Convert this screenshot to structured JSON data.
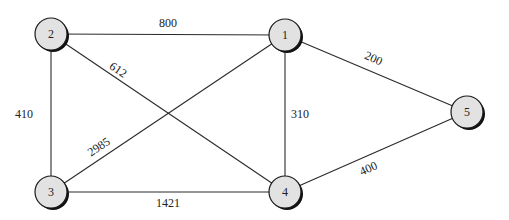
{
  "diagram": {
    "type": "weighted-undirected-graph",
    "nodes": [
      {
        "id": "1",
        "label": "1",
        "x": 285,
        "y": 35
      },
      {
        "id": "2",
        "label": "2",
        "x": 51,
        "y": 34
      },
      {
        "id": "3",
        "label": "3",
        "x": 51,
        "y": 192
      },
      {
        "id": "4",
        "label": "4",
        "x": 285,
        "y": 192
      },
      {
        "id": "5",
        "label": "5",
        "x": 467,
        "y": 112
      }
    ],
    "edges": [
      {
        "from": "2",
        "to": "1",
        "weight": "800",
        "lx": 168,
        "ly": 27,
        "rot": 0
      },
      {
        "from": "2",
        "to": "4",
        "weight": "612",
        "lx": 116,
        "ly": 73,
        "rot": 34
      },
      {
        "from": "2",
        "to": "3",
        "weight": "410",
        "lx": 24,
        "ly": 118,
        "rot": 0
      },
      {
        "from": "3",
        "to": "1",
        "weight": "2985",
        "lx": 101,
        "ly": 150,
        "rot": -34
      },
      {
        "from": "1",
        "to": "4",
        "weight": "310",
        "lx": 300,
        "ly": 118,
        "rot": 0
      },
      {
        "from": "1",
        "to": "5",
        "weight": "200",
        "lx": 372,
        "ly": 62,
        "rot": 24
      },
      {
        "from": "4",
        "to": "5",
        "weight": "400",
        "lx": 370,
        "ly": 172,
        "rot": -24
      },
      {
        "from": "3",
        "to": "4",
        "weight": "1421",
        "lx": 168,
        "ly": 207,
        "rot": 0
      }
    ],
    "node_radius": 16,
    "colors": {
      "node_fill": "#e2e2e2",
      "node_stroke": "#1a1a1a",
      "edge": "#2a2a2a",
      "background": "#ffffff"
    }
  }
}
